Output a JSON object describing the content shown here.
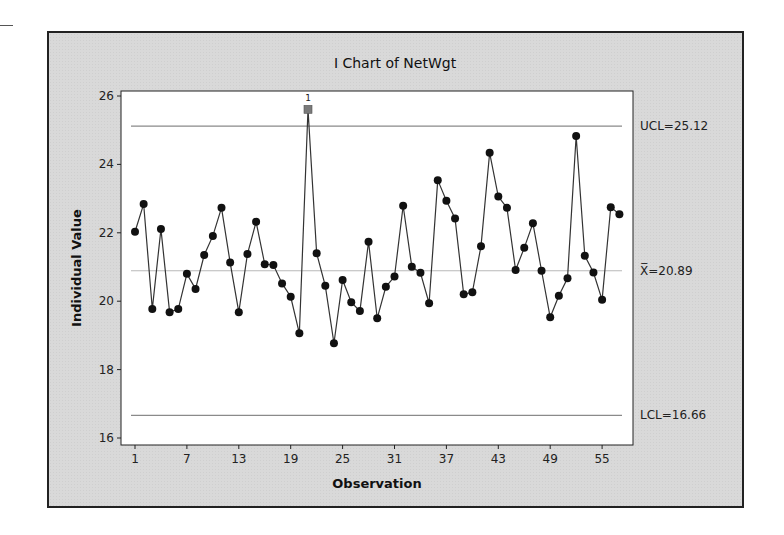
{
  "chart_data": {
    "type": "line",
    "title": "I Chart of NetWgt",
    "xlabel": "Observation",
    "ylabel": "Individual Value",
    "ylim": [
      16,
      26
    ],
    "xlim": [
      1,
      57
    ],
    "yticks": [
      16,
      18,
      20,
      22,
      24,
      26
    ],
    "xticks": [
      1,
      7,
      13,
      19,
      25,
      31,
      37,
      43,
      49,
      55
    ],
    "grid": false,
    "legend": null,
    "control_limits": {
      "UCL": 25.12,
      "mean": 20.89,
      "LCL": 16.66
    },
    "control_labels": {
      "ucl": "UCL=25.12",
      "mean": "X̅=20.89",
      "lcl": "LCL=16.66"
    },
    "out_of_control": [
      {
        "observation": 21,
        "value": 25.61,
        "test_label": "1"
      }
    ],
    "series": [
      {
        "name": "NetWgt",
        "x": [
          1,
          2,
          3,
          4,
          5,
          6,
          7,
          8,
          9,
          10,
          11,
          12,
          13,
          14,
          15,
          16,
          17,
          18,
          19,
          20,
          21,
          22,
          23,
          24,
          25,
          26,
          27,
          28,
          29,
          30,
          31,
          32,
          33,
          34,
          35,
          36,
          37,
          38,
          39,
          40,
          41,
          42,
          43,
          44,
          45,
          46,
          47,
          48,
          49,
          50,
          51,
          52,
          53,
          54,
          55,
          56,
          57
        ],
        "values": [
          22.03,
          22.84,
          19.77,
          22.11,
          19.68,
          19.77,
          20.8,
          20.36,
          21.35,
          21.91,
          22.73,
          21.13,
          19.68,
          21.38,
          22.32,
          21.08,
          21.06,
          20.52,
          20.13,
          19.06,
          25.61,
          21.4,
          20.45,
          18.77,
          20.62,
          19.97,
          19.71,
          21.74,
          19.5,
          20.42,
          20.72,
          22.79,
          21.01,
          20.83,
          19.94,
          23.54,
          22.94,
          22.42,
          20.2,
          20.26,
          21.61,
          24.34,
          23.06,
          22.73,
          20.91,
          21.56,
          22.28,
          20.89,
          19.53,
          20.16,
          20.67,
          24.83,
          21.33,
          20.84,
          20.04,
          22.75,
          22.54
        ]
      }
    ]
  },
  "colors": {
    "frame_bg": "#d9d9d9",
    "plot_bg": "#ffffff",
    "data_line": "#333333",
    "data_marker": "#111111",
    "ooc_marker": "#7a7a7a",
    "ucl_lcl_line": "#8a8a8a",
    "mean_line": "#b8b8b8"
  }
}
